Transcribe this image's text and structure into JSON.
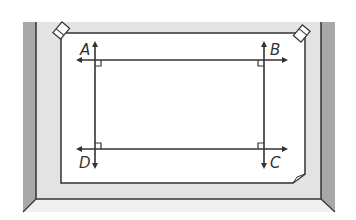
{
  "diagram": {
    "points": [
      {
        "label": "A",
        "x": 82,
        "y": 51
      },
      {
        "label": "B",
        "x": 272,
        "y": 51
      },
      {
        "label": "C",
        "x": 272,
        "y": 165
      },
      {
        "label": "D",
        "x": 82,
        "y": 165
      }
    ],
    "lines": {
      "top_horizontal": "line through A and B",
      "bottom_horizontal": "line through D and C",
      "left_vertical": "line through A and D",
      "right_vertical": "line through B and C"
    },
    "right_angle_markers": [
      "A",
      "B",
      "C",
      "D"
    ],
    "colors": {
      "wall_light": "#e3e3e3",
      "wall_dark": "#a8a8a8",
      "paper": "#ffffff",
      "ink": "#333333",
      "floor": "#f0f0f0"
    }
  }
}
